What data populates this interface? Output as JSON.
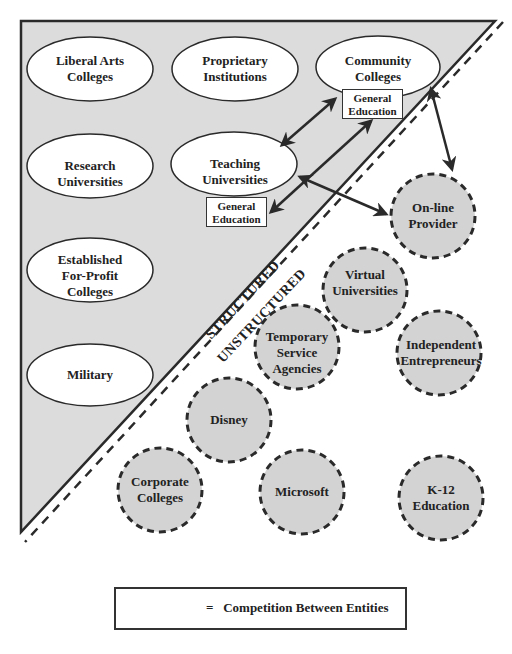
{
  "diagram": {
    "zones": {
      "structured": "STRUCTURED",
      "unstructured": "UNSTRUCTURED"
    },
    "structured_entities": [
      {
        "id": "liberal-arts",
        "label_lines": [
          "Liberal Arts",
          "Colleges"
        ]
      },
      {
        "id": "proprietary",
        "label_lines": [
          "Proprietary",
          "Institutions"
        ]
      },
      {
        "id": "community-colleges",
        "label_lines": [
          "Community",
          "Colleges"
        ]
      },
      {
        "id": "research-universities",
        "label_lines": [
          "Research",
          "Universities"
        ]
      },
      {
        "id": "teaching-universities",
        "label_lines": [
          "Teaching",
          "Universities"
        ]
      },
      {
        "id": "for-profit",
        "label_lines": [
          "Established",
          "For-Profit",
          "Colleges"
        ]
      },
      {
        "id": "military",
        "label_lines": [
          "Military"
        ]
      }
    ],
    "general_education_boxes": [
      {
        "attached_to": "community-colleges",
        "label_lines": [
          "General",
          "Education"
        ]
      },
      {
        "attached_to": "teaching-universities",
        "label_lines": [
          "General",
          "Education"
        ]
      }
    ],
    "unstructured_entities": [
      {
        "id": "online-provider",
        "label_lines": [
          "On-line",
          "Provider"
        ]
      },
      {
        "id": "virtual-universities",
        "label_lines": [
          "Virtual",
          "Universities"
        ]
      },
      {
        "id": "temporary-service-agencies",
        "label_lines": [
          "Temporary",
          "Service",
          "Agencies"
        ]
      },
      {
        "id": "independent-entrepreneurs",
        "label_lines": [
          "Independent",
          "Entrepreneurs"
        ]
      },
      {
        "id": "disney",
        "label_lines": [
          "Disney"
        ]
      },
      {
        "id": "corporate-colleges",
        "label_lines": [
          "Corporate",
          "Colleges"
        ]
      },
      {
        "id": "microsoft",
        "label_lines": [
          "Microsoft"
        ]
      },
      {
        "id": "k12-education",
        "label_lines": [
          "K-12",
          "Education"
        ]
      }
    ],
    "competition_arrows": [
      {
        "from": "community-colleges",
        "to": "teaching-universities"
      },
      {
        "from": "community-colleges.general-education",
        "to": "teaching-universities.general-education"
      },
      {
        "from": "teaching-universities",
        "to": "online-provider"
      },
      {
        "from": "community-colleges",
        "to": "online-provider"
      }
    ],
    "colors": {
      "structured_fill": "#dcdcdc",
      "unstructured_fill": "#d3d3d3",
      "ellipse_fill": "#ffffff",
      "stroke": "#2a2a2a"
    }
  },
  "legend": {
    "symbol": "double-headed-arrow",
    "equals": "=",
    "text": "Competition Between Entities"
  }
}
